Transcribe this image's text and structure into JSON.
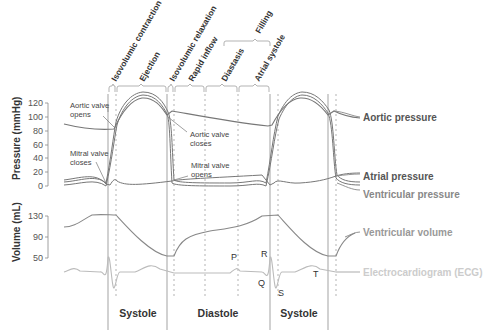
{
  "phases": {
    "isovolumic_contraction": "Isovolumic contraction",
    "ejection": "Ejection",
    "isovolumic_relaxation": "Isovolumic relaxation",
    "rapid_inflow": "Rapid inflow",
    "diastasis": "Diastasis",
    "atrial_systole": "Atrial systole",
    "filling": "Filling"
  },
  "pressure_axis": {
    "label": "Pressure (mmHg)",
    "ticks": [
      "120",
      "100",
      "80",
      "60",
      "40",
      "20",
      "0"
    ]
  },
  "volume_axis": {
    "label": "Volume (mL)",
    "ticks": [
      "130",
      "90",
      "50"
    ]
  },
  "annotations": {
    "aortic_opens_1": "Aortic valve",
    "aortic_opens_2": "opens",
    "mitral_closes_1": "Mitral valve",
    "mitral_closes_2": "closes",
    "aortic_closes_1": "Aortic valve",
    "aortic_closes_2": "closes",
    "mitral_opens_1": "Mitral valve",
    "mitral_opens_2": "opens"
  },
  "legend": {
    "aortic_pressure": "Aortic pressure",
    "atrial_pressure": "Atrial pressure",
    "ventricular_pressure": "Ventricular pressure",
    "ventricular_volume": "Ventricular volume",
    "ecg": "Electrocardiogram (ECG)"
  },
  "ecg_waves": {
    "p": "P",
    "q": "Q",
    "r": "R",
    "s": "S",
    "t": "T"
  },
  "cycle_labels": {
    "systole_1": "Systole",
    "diastole": "Diastole",
    "systole_2": "Systole"
  },
  "colors": {
    "curve": "#777777",
    "guide": "#999999",
    "ecg": "#bbbbbb",
    "text_dark": "#333333"
  }
}
